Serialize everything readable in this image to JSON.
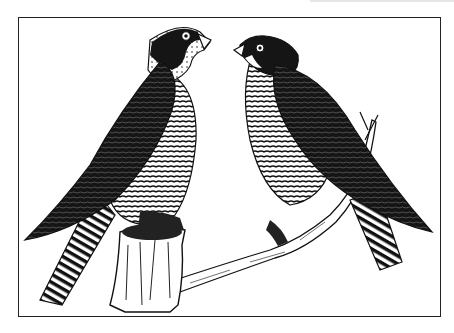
{
  "illustration": {
    "subject": "Two peregrine falcons perched on a branch",
    "style": "black-and-white pen-and-ink",
    "colors": {
      "ink": "#111111",
      "paper": "#ffffff",
      "frame": "#222222"
    },
    "birds": [
      {
        "name": "left-falcon",
        "facing": "right",
        "perch": "tree-stump"
      },
      {
        "name": "right-falcon",
        "facing": "left",
        "perch": "branch"
      }
    ]
  }
}
